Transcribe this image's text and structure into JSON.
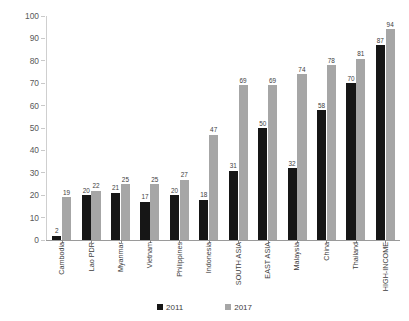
{
  "chart_data": {
    "type": "bar",
    "title": "",
    "subtitle": "",
    "xlabel": "",
    "ylabel": "Share of rural households (%)",
    "ylim": [
      0,
      100
    ],
    "ytick_step": 10,
    "yticks": [
      "0",
      "10",
      "20",
      "30",
      "40",
      "50",
      "60",
      "70",
      "80",
      "90",
      "100"
    ],
    "grid": false,
    "legend_position": "bottom",
    "categories": [
      "Cambodia",
      "Lao PDR",
      "Myanmar",
      "Vietnam",
      "Philippines",
      "Indonesia",
      "SOUTH ASIA",
      "EAST ASIA",
      "Malaysia",
      "China",
      "Thailand",
      "HIGH-INCOME"
    ],
    "series": [
      {
        "name": "2011",
        "color": "#161616",
        "values": [
          2,
          20,
          21,
          17,
          20,
          18,
          31,
          50,
          32,
          58,
          70,
          87
        ]
      },
      {
        "name": "2017",
        "color": "#a6a6a6",
        "values": [
          19,
          22,
          25,
          25,
          27,
          47,
          69,
          69,
          74,
          78,
          81,
          94
        ]
      }
    ]
  },
  "legend": {
    "items": [
      {
        "label": "2011",
        "color": "#161616"
      },
      {
        "label": "2017",
        "color": "#a6a6a6"
      }
    ]
  }
}
